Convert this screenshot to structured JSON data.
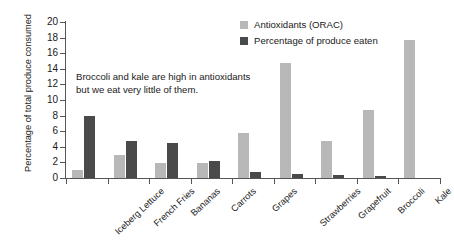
{
  "chart_data": {
    "type": "bar",
    "title": "",
    "xlabel": "",
    "ylabel": "Percentage of total produce consumed",
    "ylim": [
      0,
      20
    ],
    "ytick_step": 2,
    "yticks": [
      20,
      18,
      16,
      14,
      12,
      10,
      8,
      6,
      4,
      2,
      0
    ],
    "grid": false,
    "legend_position": "top-right",
    "categories": [
      "Iceberg Lettuce",
      "French Fries",
      "Bananas",
      "Carrots",
      "Grapes",
      "Strawberries",
      "Grapefruit",
      "Broccoli",
      "Kale"
    ],
    "series": [
      {
        "name": "Antioxidants (ORAC)",
        "color": "#b8b8b8",
        "values": [
          1.0,
          3.0,
          1.9,
          1.9,
          5.8,
          14.8,
          4.7,
          8.7,
          17.7
        ]
      },
      {
        "name": "Percentage of produce eaten",
        "color": "#4a4a4a",
        "values": [
          8.0,
          4.7,
          4.5,
          2.2,
          0.8,
          0.5,
          0.4,
          0.2,
          0.0
        ]
      }
    ],
    "annotations": [
      {
        "name": "broccoli-kale-note",
        "line1": "Broccoli and kale are high in antioxidants",
        "line2": "but we eat very little of them."
      }
    ]
  },
  "colors": {
    "orac": "#b8b8b8",
    "eaten": "#4a4a4a",
    "axis": "#555555",
    "text": "#1a1a1a",
    "background": "#ffffff"
  }
}
